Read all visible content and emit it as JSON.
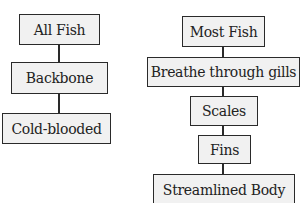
{
  "diagram": {
    "left_chain": {
      "nodes": [
        {
          "label": "All Fish"
        },
        {
          "label": "Backbone"
        },
        {
          "label": "Cold-blooded"
        }
      ]
    },
    "right_chain": {
      "nodes": [
        {
          "label": "Most Fish"
        },
        {
          "label": "Breathe through gills"
        },
        {
          "label": "Scales"
        },
        {
          "label": "Fins"
        },
        {
          "label": "Streamlined Body"
        }
      ]
    },
    "colors": {
      "box_fill": "#f1f1f1",
      "border": "#2a2a2a",
      "text": "#222222",
      "background": "#ffffff"
    }
  }
}
